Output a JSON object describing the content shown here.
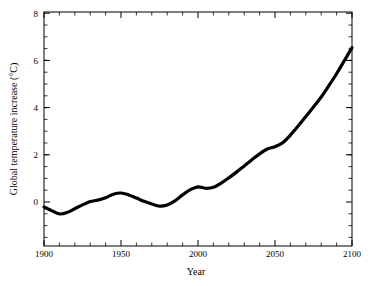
{
  "chart_data": {
    "type": "line",
    "title": "",
    "subtitle": "",
    "xlabel": "Year",
    "ylabel": "Global temperature increase (°C)",
    "xlim": [
      1900,
      2100
    ],
    "ylim": [
      -1.85,
      8
    ],
    "grid": false,
    "legend": null,
    "line_color": "#000000",
    "line_width": 3.2,
    "background_color": "#ffffff",
    "axes_color": "#000000",
    "x_major_ticks": [
      1900,
      1950,
      2000,
      2050,
      2100
    ],
    "x_major_tick_labels": [
      "1900",
      "1950",
      "2000",
      "2050",
      "2100"
    ],
    "x_minor_tick_step": 10,
    "y_major_ticks": [
      0,
      2,
      4,
      6,
      8
    ],
    "y_major_tick_labels": [
      "0",
      "2",
      "4",
      "6",
      "8"
    ],
    "y_minor_tick_step": 0.5,
    "ticks_direction": "in",
    "ticks_on_all_sides": true,
    "series": [
      {
        "name": "Global temperature increase",
        "x": [
          1900,
          1905,
          1910,
          1915,
          1920,
          1925,
          1930,
          1935,
          1940,
          1945,
          1950,
          1955,
          1960,
          1965,
          1970,
          1975,
          1980,
          1985,
          1990,
          1995,
          2000,
          2005,
          2010,
          2015,
          2020,
          2025,
          2030,
          2035,
          2040,
          2045,
          2050,
          2055,
          2060,
          2065,
          2070,
          2075,
          2080,
          2085,
          2090,
          2095,
          2100
        ],
        "y": [
          -0.21,
          -0.36,
          -0.5,
          -0.44,
          -0.28,
          -0.12,
          0.02,
          0.08,
          0.18,
          0.33,
          0.38,
          0.3,
          0.17,
          0.03,
          -0.08,
          -0.17,
          -0.12,
          0.05,
          0.3,
          0.52,
          0.64,
          0.58,
          0.62,
          0.8,
          1.02,
          1.26,
          1.52,
          1.78,
          2.03,
          2.23,
          2.33,
          2.5,
          2.82,
          3.2,
          3.6,
          4.0,
          4.42,
          4.9,
          5.4,
          5.95,
          6.5
        ]
      }
    ],
    "annotations": []
  },
  "figure": {
    "ylabel_text": "Global temperature increase (°C)",
    "xlabel_text": "Year",
    "xtick_1900": "1900",
    "xtick_1950": "1950",
    "xtick_2000": "2000",
    "xtick_2050": "2050",
    "xtick_2100": "2100",
    "ytick_0": "0",
    "ytick_2": "2",
    "ytick_4": "4",
    "ytick_6": "6",
    "ytick_8": "8"
  }
}
